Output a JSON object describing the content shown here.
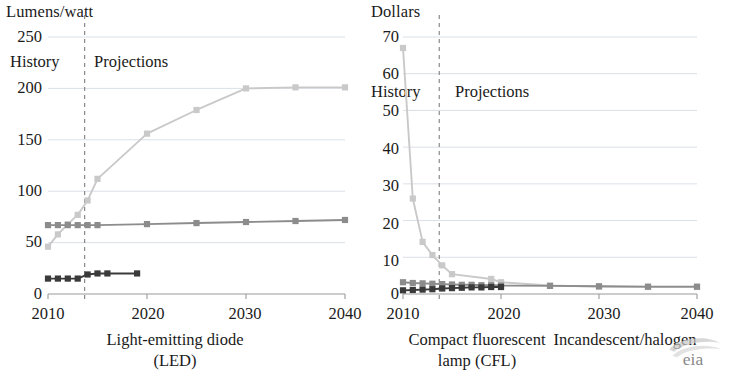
{
  "figure": {
    "source_logo": "eia-logo",
    "background": "#ffffff"
  },
  "colors": {
    "led": "#c9c9c9",
    "cfl": "#8c8c8c",
    "incandescent": "#3a3a3a",
    "grid": "#cfd6df",
    "axis": "#9a9a9a",
    "divider": "#8a8a8a",
    "text": "#1a1a1a"
  },
  "panels": [
    {
      "id": "lumens-per-watt",
      "unit_label": "Lumens/watt",
      "history_label": "History",
      "projections_label": "Projections",
      "caption_line1": "Light-emitting diode",
      "caption_line2": "(LED)",
      "yticks": [
        "250",
        "200",
        "150",
        "100",
        "50",
        "0"
      ],
      "xticks": [
        "2010",
        "2020",
        "2030",
        "2040"
      ]
    },
    {
      "id": "dollars",
      "unit_label": "Dollars",
      "history_label": "History",
      "projections_label": "Projections",
      "caption_line1": "Compact fluorescent",
      "caption_line2": "lamp (CFL)",
      "caption2_line1": "Incandescent/halogen",
      "caption2_line2": "",
      "yticks": [
        "70",
        "60",
        "50",
        "40",
        "30",
        "20",
        "10",
        "0"
      ],
      "xticks": [
        "2010",
        "2020",
        "2030",
        "2040"
      ]
    }
  ],
  "chart_data": [
    {
      "type": "line",
      "id": "lumens-per-watt",
      "title": "",
      "xlabel": "Light-emitting diode (LED)",
      "ylabel": "Lumens/watt",
      "xlim": [
        2010,
        2040
      ],
      "ylim": [
        0,
        250
      ],
      "yticks": [
        0,
        50,
        100,
        150,
        200,
        250
      ],
      "xticks": [
        2010,
        2020,
        2030,
        2040
      ],
      "grid": true,
      "legend": "none",
      "history_projection_divider_x": 2013.7,
      "annotations": [
        "History",
        "Projections"
      ],
      "series": [
        {
          "name": "Light-emitting diode (LED)",
          "color": "#c9c9c9",
          "x": [
            2010,
            2011,
            2012,
            2013,
            2014,
            2015,
            2020,
            2025,
            2030,
            2035,
            2040
          ],
          "values": [
            46,
            58,
            68,
            77,
            91,
            112,
            156,
            179,
            200,
            201,
            201
          ]
        },
        {
          "name": "Compact fluorescent lamp (CFL)",
          "color": "#8c8c8c",
          "x": [
            2010,
            2011,
            2012,
            2013,
            2014,
            2015,
            2020,
            2025,
            2030,
            2035,
            2040
          ],
          "values": [
            67,
            67,
            67,
            67,
            67,
            67,
            68,
            69,
            70,
            71,
            72
          ]
        },
        {
          "name": "Incandescent/halogen",
          "color": "#3a3a3a",
          "x": [
            2010,
            2011,
            2012,
            2013,
            2014,
            2015,
            2016,
            2019
          ],
          "values": [
            15,
            15,
            15,
            15,
            19,
            20,
            20,
            20
          ]
        }
      ]
    },
    {
      "type": "line",
      "id": "dollars",
      "title": "",
      "xlabel": "Compact fluorescent lamp (CFL) / Incandescent/halogen",
      "ylabel": "Dollars",
      "xlim": [
        2010,
        2040
      ],
      "ylim": [
        0,
        70
      ],
      "yticks": [
        0,
        10,
        20,
        30,
        40,
        50,
        60,
        70
      ],
      "xticks": [
        2010,
        2020,
        2030,
        2040
      ],
      "grid": true,
      "legend": "none",
      "history_projection_divider_x": 2013.7,
      "annotations": [
        "History",
        "Projections"
      ],
      "series": [
        {
          "name": "Light-emitting diode (LED)",
          "color": "#c9c9c9",
          "x": [
            2010,
            2011,
            2012,
            2013,
            2014,
            2015,
            2019,
            2020,
            2025,
            2030,
            2035,
            2040
          ],
          "values": [
            67,
            26,
            14.2,
            10.6,
            7.8,
            5.4,
            4.1,
            3.2,
            2.3,
            2.0,
            1.9,
            1.9
          ]
        },
        {
          "name": "Compact fluorescent lamp (CFL)",
          "color": "#8c8c8c",
          "x": [
            2010,
            2011,
            2012,
            2013,
            2014,
            2015,
            2016,
            2017,
            2018,
            2019,
            2020,
            2025,
            2030,
            2035,
            2040
          ],
          "values": [
            3.2,
            3.0,
            2.9,
            2.8,
            2.7,
            2.6,
            2.5,
            2.5,
            2.4,
            2.4,
            2.3,
            2.2,
            2.1,
            2.0,
            2.0
          ]
        },
        {
          "name": "Incandescent/halogen",
          "color": "#3a3a3a",
          "x": [
            2010,
            2011,
            2012,
            2013,
            2014,
            2015,
            2016,
            2017,
            2018,
            2019,
            2020
          ],
          "values": [
            1.0,
            1.1,
            1.2,
            1.3,
            1.5,
            1.6,
            1.7,
            1.8,
            1.8,
            1.9,
            1.9
          ]
        }
      ]
    }
  ]
}
